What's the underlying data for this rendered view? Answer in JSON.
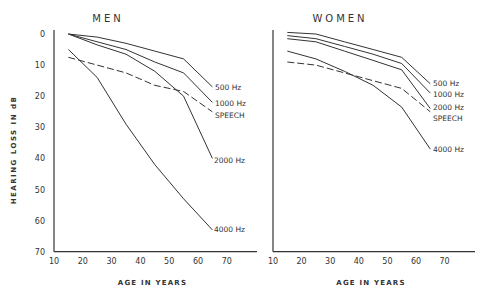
{
  "chart_data": [
    {
      "type": "line",
      "title": "MEN",
      "xlabel": "AGE IN YEARS",
      "ylabel": "HEARING LOSS IN dB",
      "xlim": [
        10,
        80
      ],
      "ylim": [
        0,
        70
      ],
      "y_inverted": true,
      "x_ticks": [
        10,
        20,
        30,
        40,
        50,
        60,
        70
      ],
      "y_ticks": [
        0,
        10,
        20,
        30,
        40,
        50,
        60,
        70
      ],
      "grid": false,
      "legend": "inline labels at line ends",
      "x": [
        15,
        25,
        35,
        45,
        55,
        65
      ],
      "series": [
        {
          "name": "500 Hz",
          "style": "solid",
          "values": [
            0,
            1,
            3,
            5.5,
            8,
            17
          ]
        },
        {
          "name": "1000 Hz",
          "style": "solid",
          "values": [
            0,
            2.5,
            5,
            9,
            12.5,
            22
          ]
        },
        {
          "name": "2000 Hz",
          "style": "solid",
          "values": [
            0,
            3.5,
            6.5,
            12,
            20,
            40
          ]
        },
        {
          "name": "4000 Hz",
          "style": "solid",
          "values": [
            5,
            14,
            29,
            42,
            53,
            63
          ]
        },
        {
          "name": "SPEECH",
          "style": "dashed",
          "values": [
            7.5,
            10,
            12.5,
            16.5,
            18.5,
            25
          ]
        }
      ]
    },
    {
      "type": "line",
      "title": "WOMEN",
      "xlabel": "AGE IN YEARS",
      "ylabel": "",
      "xlim": [
        10,
        80
      ],
      "ylim": [
        0,
        70
      ],
      "y_inverted": true,
      "x_ticks": [
        10,
        20,
        30,
        40,
        50,
        60,
        70
      ],
      "y_ticks": [],
      "grid": false,
      "legend": "inline labels at line ends",
      "x": [
        15,
        25,
        35,
        45,
        55,
        65
      ],
      "series": [
        {
          "name": "500 Hz",
          "style": "solid",
          "values": [
            -0.5,
            0,
            2.5,
            5,
            7.5,
            16
          ]
        },
        {
          "name": "1000 Hz",
          "style": "solid",
          "values": [
            0.5,
            1.5,
            4,
            6.5,
            9.5,
            19
          ]
        },
        {
          "name": "2000 Hz",
          "style": "solid",
          "values": [
            1.5,
            2.5,
            5.5,
            8.5,
            11.5,
            24
          ]
        },
        {
          "name": "4000 Hz",
          "style": "solid",
          "values": [
            5.5,
            8,
            12,
            16.5,
            23.5,
            37
          ]
        },
        {
          "name": "SPEECH",
          "style": "dashed",
          "values": [
            9,
            10,
            12.5,
            15,
            17.5,
            25
          ]
        }
      ]
    }
  ],
  "panels": {
    "men": {
      "title": "MEN",
      "xlabel": "AGE IN YEARS",
      "labels": {
        "s500": "500 Hz",
        "s1000": "1000 Hz",
        "speech": "SPEECH",
        "s2000": "2000 Hz",
        "s4000": "4000 Hz"
      }
    },
    "women": {
      "title": "WOMEN",
      "xlabel": "AGE IN YEARS",
      "labels": {
        "s500": "500 Hz",
        "s1000": "1000 Hz",
        "s2000": "2000 Hz",
        "speech": "SPEECH",
        "s4000": "4000 Hz"
      }
    },
    "ylabel": "HEARING LOSS IN dB"
  }
}
